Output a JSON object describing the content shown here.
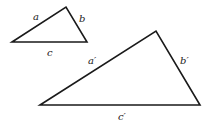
{
  "diagram": {
    "type": "similar-triangles",
    "colors": {
      "stroke": "#1a1a1a",
      "text": "#222222",
      "background": "#ffffff"
    },
    "small_triangle": {
      "vertices": {
        "left": [
          12,
          42
        ],
        "apex": [
          66,
          7
        ],
        "right": [
          87,
          42
        ]
      },
      "labels": {
        "a": "a",
        "b": "b",
        "c": "c"
      },
      "label_positions": {
        "a": [
          33,
          20
        ],
        "b": [
          79,
          22
        ],
        "c": [
          47,
          56
        ]
      }
    },
    "large_triangle": {
      "vertices": {
        "left": [
          40,
          105
        ],
        "apex": [
          156,
          31
        ],
        "right": [
          200,
          105
        ]
      },
      "labels": {
        "a": "a′",
        "b": "b′",
        "c": "c′"
      },
      "label_positions": {
        "a": [
          88,
          64
        ],
        "b": [
          180,
          64
        ],
        "c": [
          118,
          120
        ]
      }
    }
  }
}
